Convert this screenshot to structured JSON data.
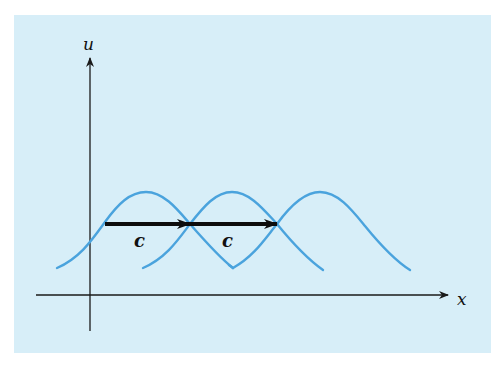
{
  "figure": {
    "background_color": "#d7eef8",
    "curve_color": "#4aa3dd",
    "axis_color": "#1a1a1a",
    "arrow_color": "#0d0d0d",
    "axes": {
      "y_label": "u",
      "x_label": "x"
    },
    "waves": [
      {
        "name": "wave-1",
        "peak_x": 146
      },
      {
        "name": "wave-2",
        "peak_x": 232
      },
      {
        "name": "wave-3",
        "peak_x": 320
      }
    ],
    "translation_arrows": [
      {
        "label": "c"
      },
      {
        "label": "c"
      }
    ]
  }
}
